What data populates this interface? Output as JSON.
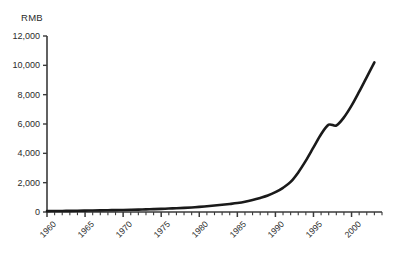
{
  "chart_data": {
    "type": "line",
    "title": "",
    "subtitle": "",
    "xlabel": "",
    "ylabel": "RMB",
    "unit_label": "RMB",
    "grid": false,
    "legend": false,
    "legend_position": "none",
    "xlim": [
      1960,
      2004
    ],
    "ylim": [
      0,
      12000
    ],
    "y_ticks": [
      0,
      2000,
      4000,
      6000,
      8000,
      10000,
      12000
    ],
    "y_tick_labels": [
      "0",
      "2,000",
      "4,000",
      "6,000",
      "8,000",
      "10,000",
      "12,000"
    ],
    "x_ticks": [
      1960,
      1965,
      1970,
      1975,
      1980,
      1985,
      1990,
      1995,
      2000
    ],
    "x_tick_labels": [
      "1960",
      "1965",
      "1970",
      "1975",
      "1980",
      "1985",
      "1990",
      "1995",
      "2000"
    ],
    "x_minor_tick_interval": 1,
    "line_color": "#1a1a1a",
    "line_width": 2.6,
    "axis_color": "#3a3a3a",
    "series": [
      {
        "name": "RMB",
        "x": [
          1960,
          1961,
          1962,
          1963,
          1964,
          1965,
          1966,
          1967,
          1968,
          1969,
          1970,
          1971,
          1972,
          1973,
          1974,
          1975,
          1976,
          1977,
          1978,
          1979,
          1980,
          1981,
          1982,
          1983,
          1984,
          1985,
          1986,
          1987,
          1988,
          1989,
          1990,
          1991,
          1992,
          1993,
          1994,
          1995,
          1996,
          1997,
          1998,
          1999,
          2000,
          2001,
          2002,
          2003
        ],
        "values": [
          60,
          65,
          70,
          78,
          85,
          95,
          105,
          112,
          120,
          130,
          140,
          150,
          165,
          180,
          195,
          215,
          235,
          255,
          280,
          310,
          350,
          395,
          440,
          490,
          545,
          610,
          700,
          820,
          960,
          1120,
          1350,
          1650,
          2050,
          2700,
          3500,
          4400,
          5300,
          5950,
          5900,
          6450,
          7250,
          8200,
          9200,
          10200
        ]
      }
    ]
  },
  "axis_geometry": {
    "plot_left_px": 47,
    "plot_right_px": 382,
    "plot_top_px": 36,
    "plot_bottom_px": 212
  }
}
